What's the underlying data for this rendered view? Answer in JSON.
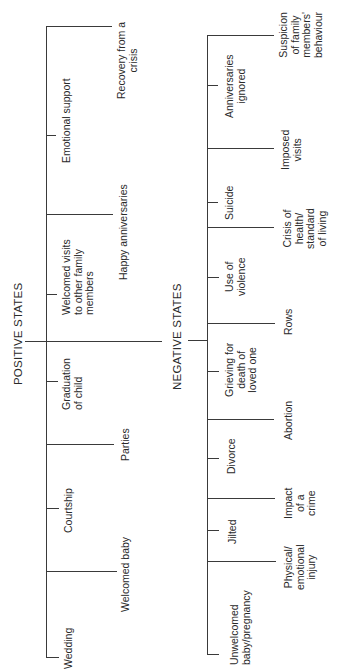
{
  "positive": {
    "title": "POSITIVE STATES",
    "items": [
      {
        "label": "Wedding",
        "branch": "short"
      },
      {
        "label": "Welcomed baby",
        "branch": "long"
      },
      {
        "label": "Courtship",
        "branch": "short"
      },
      {
        "label": "Parties",
        "branch": "long"
      },
      {
        "label": "Graduation\nof child",
        "branch": "short"
      },
      {
        "label": "Welcomed visits\nto other family\nmembers",
        "branch": "short"
      },
      {
        "label": "Happy anniversaries",
        "branch": "long"
      },
      {
        "label": "Emotional support",
        "branch": "short"
      },
      {
        "label": "Recovery from a\ncrisis",
        "branch": "long"
      }
    ]
  },
  "negative": {
    "title": "NEGATIVE STATES",
    "items": [
      {
        "label": "Unwelcomed\nbaby/pregnancy",
        "branch": "short"
      },
      {
        "label": "Physical/\nemotional\ninjury",
        "branch": "long"
      },
      {
        "label": "Jilted",
        "branch": "short"
      },
      {
        "label": "Impact\nof a\ncrime",
        "branch": "long"
      },
      {
        "label": "Divorce",
        "branch": "short"
      },
      {
        "label": "Abortion",
        "branch": "long"
      },
      {
        "label": "Grieving for\ndeath of\nloved one",
        "branch": "short"
      },
      {
        "label": "Rows",
        "branch": "long"
      },
      {
        "label": "Use of\nviolence",
        "branch": "short"
      },
      {
        "label": "Crisis of\nhealth/\nstandard\nof living",
        "branch": "long"
      },
      {
        "label": "Suicide",
        "branch": "short"
      },
      {
        "label": "Imposed\nvisits",
        "branch": "long"
      },
      {
        "label": "Anniversaries\nignored",
        "branch": "short"
      },
      {
        "label": "Suspicion\nof family\nmembers'\nbehaviour",
        "branch": "long"
      }
    ]
  }
}
